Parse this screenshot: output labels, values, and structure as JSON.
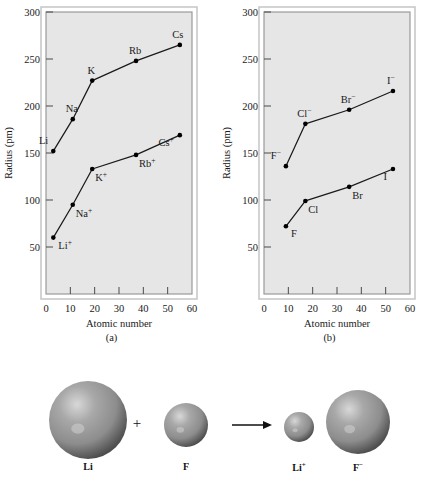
{
  "figure": {
    "panels": [
      {
        "caption": "(a)",
        "axis": {
          "xlabel": "Atomic number",
          "ylabel": "Radius (pm)",
          "xticks": [
            "0",
            "10",
            "20",
            "30",
            "40",
            "50",
            "60"
          ],
          "yticks": [
            "50",
            "100",
            "150",
            "200",
            "250",
            "300"
          ]
        }
      },
      {
        "caption": "(b)",
        "axis": {
          "xlabel": "Atomic number",
          "ylabel": "Radius (pm)",
          "xticks": [
            "0",
            "10",
            "20",
            "30",
            "40",
            "50",
            "60"
          ],
          "yticks": [
            "50",
            "100",
            "150",
            "200",
            "250",
            "300"
          ]
        }
      }
    ]
  },
  "illustration": {
    "spheres": [
      {
        "label": "Li",
        "sup": ""
      },
      {
        "label": "F",
        "sup": ""
      },
      {
        "label": "Li",
        "sup": "+"
      },
      {
        "label": "F",
        "sup": "−"
      }
    ],
    "plus_symbol": "+",
    "arrow_symbol": "→"
  },
  "colors": {
    "plot_background": "#e6e6e6",
    "frame": "#9a9a9a",
    "line": "#1a1a1a",
    "marker": "#000000",
    "sphere_base": "#8d8d8d",
    "sphere_highlight": "#d8d8d8",
    "sphere_shadow": "#4e4e4e",
    "page_background": "#ffffff"
  },
  "chart_data": [
    {
      "type": "line",
      "title": "(a)",
      "xlabel": "Atomic number",
      "ylabel": "Radius (pm)",
      "xlim": [
        0,
        60
      ],
      "ylim": [
        0,
        300
      ],
      "xticks": [
        0,
        10,
        20,
        30,
        40,
        50,
        60
      ],
      "yticks": [
        50,
        100,
        150,
        200,
        250,
        300
      ],
      "grid": false,
      "legend": "none",
      "series": [
        {
          "name": "Alkali metal atoms",
          "point_labels": [
            "Li",
            "Na",
            "K",
            "Rb",
            "Cs"
          ],
          "x": [
            3,
            11,
            19,
            37,
            55
          ],
          "y": [
            152,
            186,
            227,
            248,
            265
          ]
        },
        {
          "name": "Alkali metal cations",
          "point_labels": [
            "Li⁺",
            "Na⁺",
            "K⁺",
            "Rb⁺",
            "Cs⁺"
          ],
          "x": [
            3,
            11,
            19,
            37,
            55
          ],
          "y": [
            60,
            95,
            133,
            148,
            169
          ]
        }
      ]
    },
    {
      "type": "line",
      "title": "(b)",
      "xlabel": "Atomic number",
      "ylabel": "Radius (pm)",
      "xlim": [
        0,
        60
      ],
      "ylim": [
        0,
        300
      ],
      "xticks": [
        0,
        10,
        20,
        30,
        40,
        50,
        60
      ],
      "yticks": [
        50,
        100,
        150,
        200,
        250,
        300
      ],
      "grid": false,
      "legend": "none",
      "series": [
        {
          "name": "Halogen anions",
          "point_labels": [
            "F⁻",
            "Cl⁻",
            "Br⁻",
            "I⁻"
          ],
          "x": [
            9,
            17,
            35,
            53
          ],
          "y": [
            136,
            181,
            196,
            216
          ]
        },
        {
          "name": "Halogen atoms",
          "point_labels": [
            "F",
            "Cl",
            "Br",
            "I"
          ],
          "x": [
            9,
            17,
            35,
            53
          ],
          "y": [
            72,
            99,
            114,
            133
          ]
        }
      ]
    }
  ]
}
